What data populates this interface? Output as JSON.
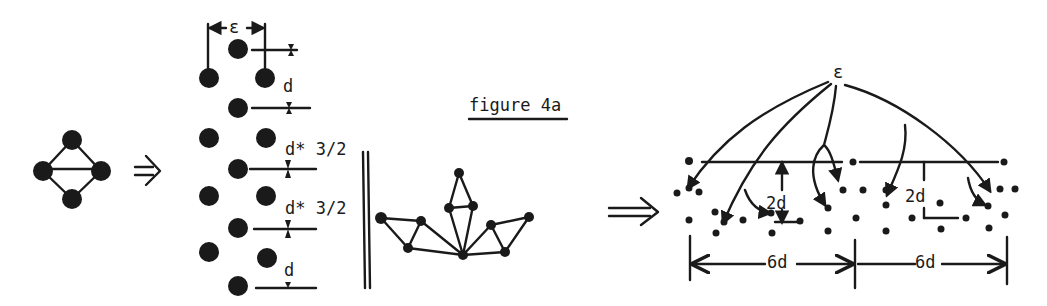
{
  "figure": {
    "title": "figure 4a",
    "implies_arrow_1": "⇒",
    "implies_arrow_2": "⇒"
  },
  "panel_molecule": {
    "description": "four-atom rhombic cluster with central bond",
    "atoms": 4
  },
  "panel_columns": {
    "labels": {
      "epsilon": "ε",
      "d_top": "d",
      "d_32_a": "d* 3/2",
      "d_32_b": "d* 3/2",
      "d_bottom": "d"
    }
  },
  "panel_crown": {
    "description": "fan of triangulated atoms on a wall",
    "nodes": 9
  },
  "panel_surface": {
    "labels": {
      "epsilon": "ε",
      "spacing_left": "2d",
      "spacing_right": "2d",
      "width_left": "6d",
      "width_right": "6d"
    }
  }
}
